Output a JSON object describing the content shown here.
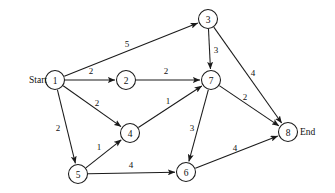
{
  "diagram": {
    "type": "directed-weighted-graph",
    "width": 335,
    "height": 193,
    "background_color": "#ffffff",
    "stroke_color": "#1a1a1a",
    "text_color": "#111111",
    "terminals": {
      "start_label": "Start",
      "start_node": "1",
      "start_label_x": 47,
      "start_label_y": 80,
      "end_label": "End",
      "end_node": "8",
      "end_label_x": 300,
      "end_label_y": 132
    },
    "node_radius": 9.5,
    "nodes": [
      {
        "id": "1",
        "label": "1",
        "x": 55,
        "y": 80
      },
      {
        "id": "2",
        "label": "2",
        "x": 126,
        "y": 80
      },
      {
        "id": "3",
        "label": "3",
        "x": 208,
        "y": 19
      },
      {
        "id": "4",
        "label": "4",
        "x": 130,
        "y": 133
      },
      {
        "id": "5",
        "label": "5",
        "x": 78,
        "y": 174
      },
      {
        "id": "6",
        "label": "6",
        "x": 186,
        "y": 172
      },
      {
        "id": "7",
        "label": "7",
        "x": 211,
        "y": 80
      },
      {
        "id": "8",
        "label": "8",
        "x": 288,
        "y": 132
      }
    ],
    "edges": [
      {
        "from": "1",
        "to": "3",
        "weight": "5",
        "label_x": 127,
        "label_y": 44
      },
      {
        "from": "1",
        "to": "2",
        "weight": "2",
        "label_x": 91,
        "label_y": 71
      },
      {
        "from": "1",
        "to": "4",
        "weight": "2",
        "label_x": 97,
        "label_y": 103
      },
      {
        "from": "1",
        "to": "5",
        "weight": "2",
        "label_x": 58,
        "label_y": 128
      },
      {
        "from": "2",
        "to": "7",
        "weight": "2",
        "label_x": 166,
        "label_y": 71
      },
      {
        "from": "3",
        "to": "7",
        "weight": "3",
        "label_x": 216,
        "label_y": 50
      },
      {
        "from": "3",
        "to": "8",
        "weight": "4",
        "label_x": 253,
        "label_y": 73
      },
      {
        "from": "4",
        "to": "7",
        "weight": "1",
        "label_x": 168,
        "label_y": 101
      },
      {
        "from": "5",
        "to": "4",
        "weight": "1",
        "label_x": 99,
        "label_y": 147
      },
      {
        "from": "5",
        "to": "6",
        "weight": "4",
        "label_x": 131,
        "label_y": 165
      },
      {
        "from": "7",
        "to": "6",
        "weight": "3",
        "label_x": 192,
        "label_y": 128
      },
      {
        "from": "7",
        "to": "8",
        "weight": "2",
        "label_x": 245,
        "label_y": 97
      },
      {
        "from": "6",
        "to": "8",
        "weight": "4",
        "label_x": 235,
        "label_y": 148
      }
    ]
  }
}
